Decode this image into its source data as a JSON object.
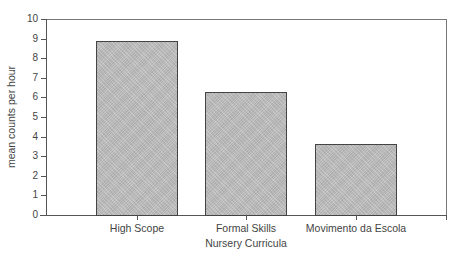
{
  "chart_data": {
    "type": "bar",
    "title": "",
    "xlabel": "Nursery Curricula",
    "ylabel": "mean counts per hour",
    "categories": [
      "High Scope",
      "Formal Skills",
      "Movimento da Escola"
    ],
    "values": [
      8.9,
      6.3,
      3.6
    ],
    "ylim": [
      0,
      10
    ],
    "yticks": [
      "0",
      "1",
      "2",
      "3",
      "4",
      "5",
      "6",
      "7",
      "8",
      "9",
      "10"
    ],
    "grid": false,
    "legend": null,
    "bar_color": "#bdbdbd"
  }
}
